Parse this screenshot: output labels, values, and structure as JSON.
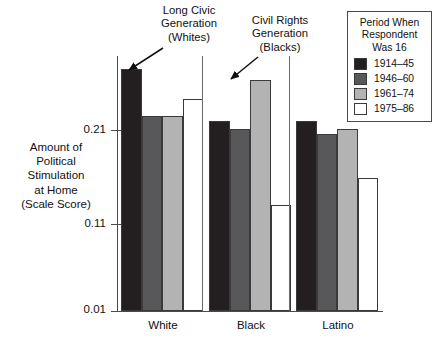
{
  "chart_data": {
    "type": "bar",
    "title": "",
    "xlabel": "",
    "ylabel": "Amount of Political Stimulation at Home (Scale Score)",
    "categories": [
      "White",
      "Black",
      "Latino"
    ],
    "series": [
      {
        "name": "1914–45",
        "color": "#231f20",
        "values": [
          0.265,
          0.21,
          0.21
        ]
      },
      {
        "name": "1946–60",
        "color": "#58585a",
        "values": [
          0.215,
          0.201,
          0.196
        ]
      },
      {
        "name": "1961–74",
        "color": "#b3b3b3",
        "values": [
          0.215,
          0.253,
          0.201
        ]
      },
      {
        "name": "1975–86",
        "color": "#ffffff",
        "values": [
          0.233,
          0.122,
          0.15
        ]
      }
    ],
    "ylim": [
      0.01,
      0.275
    ],
    "yticks": [
      0.21,
      0.11,
      0.01
    ],
    "ytick_labels": [
      "0.21",
      "0.11",
      "0.01"
    ],
    "grid": false,
    "legend_position": "top-right",
    "annotations": [
      {
        "text": "Long Civic Generation (Whites)",
        "target": "White / 1914–45 bar"
      },
      {
        "text": "Civil Rights Generation (Blacks)",
        "target": "Black / 1961–74 bar"
      }
    ]
  },
  "axis": {
    "y_caption_lines": [
      "Amount of",
      "Political",
      "Stimulation",
      "at Home",
      "(Scale Score)"
    ],
    "y_ticks": [
      {
        "label": "0.21",
        "value": 0.21
      },
      {
        "label": "0.11",
        "value": 0.11
      },
      {
        "label": "0.01",
        "value": 0.01
      }
    ],
    "x_categories": [
      "White",
      "Black",
      "Latino"
    ]
  },
  "legend": {
    "title_lines": [
      "Period When",
      "Respondent",
      "Was 16"
    ],
    "items": [
      {
        "label": "1914–45",
        "color": "#231f20"
      },
      {
        "label": "1946–60",
        "color": "#58585a"
      },
      {
        "label": "1961–74",
        "color": "#b3b3b3"
      },
      {
        "label": "1975–86",
        "color": "#ffffff"
      }
    ]
  },
  "annotations": {
    "civic": {
      "lines": [
        "Long Civic",
        "Generation",
        "(Whites)"
      ]
    },
    "rights": {
      "lines": [
        "Civil Rights",
        "Generation",
        "(Blacks)"
      ]
    }
  },
  "colors": {
    "axis": "#4b4b4b",
    "bar_outline": "#3a3a3a",
    "text": "#111111",
    "background": "#ffffff"
  }
}
